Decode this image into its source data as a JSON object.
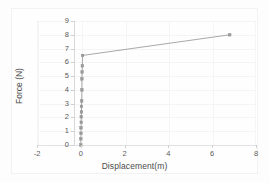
{
  "chart_data": {
    "type": "line",
    "title": "",
    "subtitle": "",
    "xlabel": "Displacement(m)",
    "ylabel": "Force (N)",
    "xlim": [
      -2,
      8
    ],
    "ylim": [
      0,
      9
    ],
    "xticks": [
      -2,
      0,
      2,
      4,
      6,
      8
    ],
    "xtick_labels": [
      "-2",
      "0",
      "2",
      "4",
      "6",
      "8"
    ],
    "yticks": [
      0,
      1,
      2,
      3,
      4,
      5,
      6,
      7,
      8,
      9
    ],
    "ytick_labels": [
      "0",
      "1",
      "2",
      "3",
      "4",
      "5",
      "6",
      "7",
      "8",
      "9"
    ],
    "grid": true,
    "legend": null,
    "legend_position": "none",
    "marker": "square",
    "marker_color": "#9a9a9a",
    "line_color": "#9e9e9e",
    "series": [
      {
        "name": "Force vs Displacement",
        "x": [
          0.0,
          0.0,
          0.01,
          0.01,
          0.02,
          0.02,
          0.03,
          0.03,
          0.04,
          0.05,
          0.05,
          0.06,
          0.07,
          0.08,
          6.8
        ],
        "y": [
          0.0,
          0.45,
          0.85,
          1.25,
          1.65,
          2.05,
          2.4,
          2.8,
          3.2,
          4.0,
          4.8,
          5.3,
          5.75,
          6.5,
          8.0
        ]
      }
    ],
    "annotations": []
  },
  "figure": {
    "background_color": "#fdfdfd",
    "plot_background_color": "#fefefe",
    "grid_color": "#f4f4f4",
    "axis_color": "#d8d8d8",
    "tick_label_color": "#5a5a5a",
    "axis_label_color": "#4a4a4a"
  }
}
